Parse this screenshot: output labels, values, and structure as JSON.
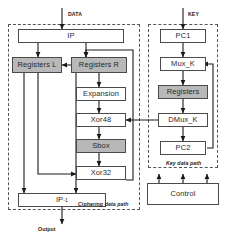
{
  "diagram": {
    "inputs": [
      {
        "name": "data-input-label",
        "label": "DATA"
      },
      {
        "name": "key-input-label",
        "label": "KEY"
      }
    ],
    "outputs": [
      {
        "name": "output-label",
        "label": "Output"
      }
    ],
    "groups": [
      {
        "name": "ciphering-data-path-group",
        "label": "Ciphering data path"
      },
      {
        "name": "key-data-path-group",
        "label": "Key data path"
      }
    ],
    "blocks": {
      "ip": {
        "label": "IP",
        "shaded": false
      },
      "registers_l": {
        "label": "Registers L",
        "shaded": true
      },
      "registers_r": {
        "label": "Registers R",
        "shaded": true
      },
      "expansion": {
        "label": "Expansion",
        "shaded": false
      },
      "xor48": {
        "label": "Xor48",
        "shaded": false
      },
      "sbox": {
        "label": "Sbox",
        "shaded": true
      },
      "xor32": {
        "label": "Xor32",
        "shaded": false
      },
      "ip_inverse": {
        "label": "IP",
        "superscript": "-1",
        "shaded": false
      },
      "pc1": {
        "label": "PC1",
        "shaded": false
      },
      "mux_k": {
        "label": "Mux_K",
        "shaded": false
      },
      "registers_k": {
        "label": "Registers",
        "shaded": true
      },
      "dmux_k": {
        "label": "DMux_K",
        "shaded": false
      },
      "pc2": {
        "label": "PC2",
        "shaded": false
      },
      "control": {
        "label": "Control",
        "shaded": false
      }
    },
    "colors": {
      "shaded_fill": "#b8b8b8",
      "box_border": "#4a4a4a",
      "group_border": "#555555",
      "wire": "#1a1a1a",
      "background": "#ffffff"
    }
  }
}
